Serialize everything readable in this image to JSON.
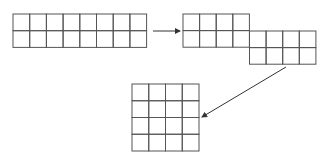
{
  "diagram": {
    "colors": {
      "line": "#555555",
      "arrow": "#333333",
      "background": "#ffffff"
    },
    "shapes": [
      {
        "id": "strip-2x8",
        "rows": 2,
        "cols": 8,
        "x": 13,
        "y": 14,
        "cell": 16.7
      },
      {
        "id": "staggered",
        "blocks": [
          {
            "rows": 2,
            "cols": 4,
            "x": 183,
            "y": 14,
            "cell": 16.6
          },
          {
            "rows": 2,
            "cols": 4,
            "x": 249.5,
            "y": 31,
            "cell": 16.6
          }
        ]
      },
      {
        "id": "square-4x4",
        "rows": 4,
        "cols": 4,
        "x": 132,
        "y": 84,
        "cell": 16.75
      }
    ],
    "arrows": [
      {
        "id": "arrow-1",
        "from": [
          153,
          31
        ],
        "to": [
          180,
          31
        ]
      },
      {
        "id": "arrow-2",
        "from": [
          286,
          67
        ],
        "to": [
          202,
          117
        ]
      }
    ]
  }
}
